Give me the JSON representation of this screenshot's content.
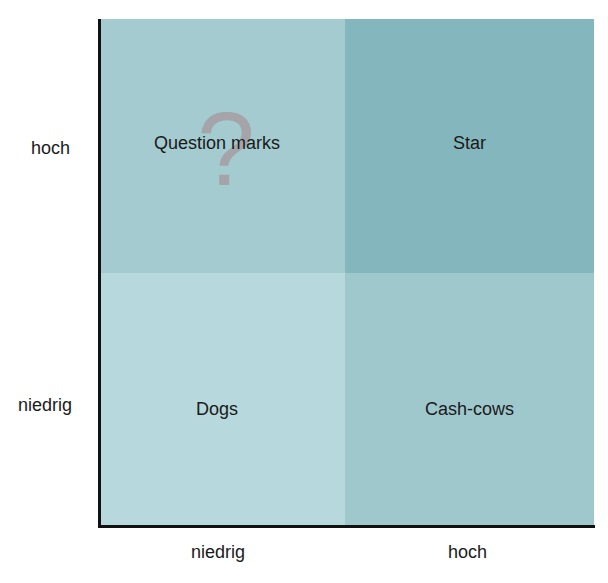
{
  "diagram": {
    "type": "portfolio-matrix",
    "y_axis": {
      "high_label": "hoch",
      "low_label": "niedrig"
    },
    "x_axis": {
      "low_label": "niedrig",
      "high_label": "hoch"
    },
    "quadrants": {
      "top_left": {
        "label": "Question marks",
        "icon": "question-mark-icon",
        "icon_glyph": "?",
        "color": "#a3cbd0"
      },
      "top_right": {
        "label": "Star",
        "color": "#84b7bd"
      },
      "bottom_left": {
        "label": "Dogs",
        "color": "#b7d8dc"
      },
      "bottom_right": {
        "label": "Cash-cows",
        "color": "#9fc8cd"
      }
    }
  }
}
